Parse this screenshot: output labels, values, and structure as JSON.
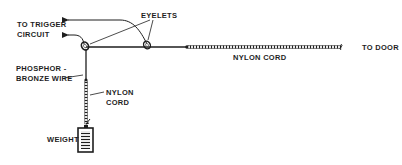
{
  "diagram": {
    "type": "mechanical-schematic",
    "colors": {
      "ink": "#1e1e1e",
      "background": "#ffffff"
    },
    "labels": {
      "to_trigger_line1": "TO TRIGGER",
      "to_trigger_line2": "CIRCUIT",
      "eyelets": "EYELETS",
      "phosphor_line1": "PHOSPHOR -",
      "phosphor_line2": "BRONZE WIRE",
      "nylon_horizontal": "NYLON CORD",
      "to_door": "TO DOOR",
      "nylon_vertical_line1": "NYLON",
      "nylon_vertical_line2": "CORD",
      "weight": "WEIGHT"
    },
    "components": [
      {
        "name": "eyelet",
        "count": 2
      },
      {
        "name": "phosphor-bronze wire"
      },
      {
        "name": "nylon cord",
        "segments": [
          "horizontal to door",
          "vertical to weight"
        ]
      },
      {
        "name": "weight"
      }
    ],
    "connections": [
      {
        "from": "phosphor-bronze wire",
        "to": "trigger circuit",
        "count": 2
      },
      {
        "from": "nylon cord",
        "to": "door"
      },
      {
        "from": "nylon cord",
        "to": "weight"
      }
    ]
  }
}
